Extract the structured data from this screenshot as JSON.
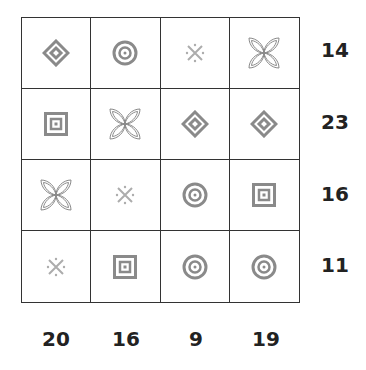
{
  "puzzle": {
    "grid": [
      [
        "diamond",
        "target",
        "asterisk",
        "clover"
      ],
      [
        "square",
        "clover",
        "diamond",
        "diamond"
      ],
      [
        "clover",
        "asterisk",
        "target",
        "square"
      ],
      [
        "asterisk",
        "square",
        "target",
        "target"
      ]
    ],
    "row_sums": [
      "14",
      "23",
      "16",
      "11"
    ],
    "col_sums": [
      "20",
      "16",
      "9",
      "19"
    ]
  },
  "colors": {
    "grid_line": "#333333",
    "symbol": "#8a8a8a",
    "text": "#222222"
  }
}
